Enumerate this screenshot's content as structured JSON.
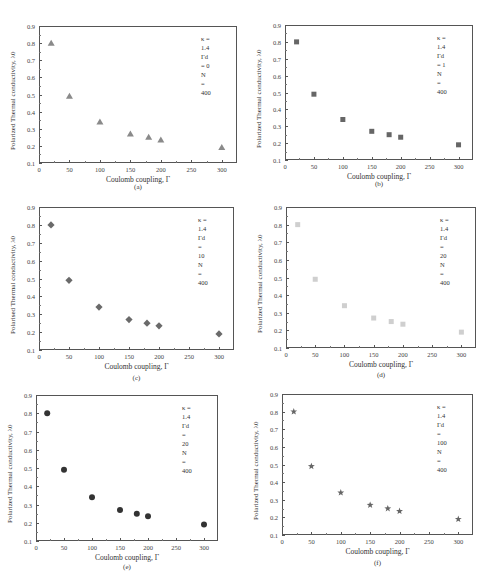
{
  "chart_data": [
    {
      "id": "a",
      "type": "scatter",
      "caption": "(a)",
      "marker": "triangle",
      "color": "#8a8a8a",
      "xlabel": "Coulomb coupling, Γ",
      "ylabel": "Polarized Thermal conductivity, λ0",
      "xlim": [
        0,
        325
      ],
      "ylim": [
        0.1,
        0.9
      ],
      "xticks": [
        0,
        50,
        100,
        150,
        200,
        250,
        300
      ],
      "yticks": [
        0.1,
        0.2,
        0.3,
        0.4,
        0.5,
        0.6,
        0.7,
        0.8,
        0.9
      ],
      "legend": [
        "κ = 1.4",
        "Γd = 0",
        "N = 400"
      ],
      "x": [
        20,
        50,
        100,
        150,
        180,
        200,
        300
      ],
      "y": [
        0.8,
        0.49,
        0.34,
        0.27,
        0.25,
        0.235,
        0.19
      ]
    },
    {
      "id": "b",
      "type": "scatter",
      "caption": "(b)",
      "marker": "square",
      "color": "#666666",
      "xlabel": "Coulomb coupling, Γ",
      "ylabel": "Polarized Thermal conductivity, λ0",
      "xlim": [
        0,
        325
      ],
      "ylim": [
        0.1,
        0.9
      ],
      "xticks": [
        0,
        50,
        100,
        150,
        200,
        250,
        300
      ],
      "yticks": [
        0.1,
        0.2,
        0.3,
        0.4,
        0.5,
        0.6,
        0.7,
        0.8,
        0.9
      ],
      "legend": [
        "κ = 1.4",
        "Γd = 1",
        "N = 400"
      ],
      "x": [
        20,
        50,
        100,
        150,
        180,
        200,
        300
      ],
      "y": [
        0.8,
        0.49,
        0.34,
        0.27,
        0.25,
        0.235,
        0.19
      ]
    },
    {
      "id": "c",
      "type": "scatter",
      "caption": "(c)",
      "marker": "diamond",
      "color": "#6a6a6a",
      "xlabel": "Coulomb coupling, Γ",
      "ylabel": "Polarised Thermal conductivity, λ0",
      "xlim": [
        0,
        325
      ],
      "ylim": [
        0.1,
        0.9
      ],
      "xticks": [
        0,
        50,
        100,
        150,
        200,
        250,
        300
      ],
      "yticks": [
        0.1,
        0.2,
        0.3,
        0.4,
        0.5,
        0.6,
        0.7,
        0.8,
        0.9
      ],
      "legend": [
        "κ = 1.4",
        "Γd = 10",
        "N = 400"
      ],
      "x": [
        20,
        50,
        100,
        150,
        180,
        200,
        300
      ],
      "y": [
        0.8,
        0.49,
        0.34,
        0.27,
        0.25,
        0.235,
        0.19
      ]
    },
    {
      "id": "d",
      "type": "scatter",
      "caption": "(d)",
      "marker": "square-light",
      "color": "#cfcfcf",
      "xlabel": "Coulomb coupling, Γ",
      "ylabel": "Polarized Thermal conductivity, λ0",
      "xlim": [
        0,
        325
      ],
      "ylim": [
        0.1,
        0.9
      ],
      "xticks": [
        0,
        50,
        100,
        150,
        200,
        250,
        300
      ],
      "yticks": [
        0.1,
        0.2,
        0.3,
        0.4,
        0.5,
        0.6,
        0.7,
        0.8,
        0.9
      ],
      "legend": [
        "κ = 1.4",
        "Γd = 20",
        "N = 400"
      ],
      "x": [
        20,
        50,
        100,
        150,
        180,
        200,
        300
      ],
      "y": [
        0.8,
        0.49,
        0.34,
        0.27,
        0.25,
        0.235,
        0.19
      ]
    },
    {
      "id": "e",
      "type": "scatter",
      "caption": "(e)",
      "marker": "circle",
      "color": "#333333",
      "xlabel": "Coulomb coupling, Γ",
      "ylabel": "Polarized Thermal conductivity, λ0",
      "xlim": [
        0,
        325
      ],
      "ylim": [
        0.1,
        0.9
      ],
      "xticks": [
        0,
        50,
        100,
        150,
        200,
        250,
        300
      ],
      "yticks": [
        0.1,
        0.2,
        0.3,
        0.4,
        0.5,
        0.6,
        0.7,
        0.8,
        0.9
      ],
      "legend": [
        "κ = 1.4",
        "Γd = 20",
        "N = 400"
      ],
      "x": [
        20,
        50,
        100,
        150,
        180,
        200,
        300
      ],
      "y": [
        0.8,
        0.49,
        0.34,
        0.27,
        0.25,
        0.235,
        0.19
      ]
    },
    {
      "id": "f",
      "type": "scatter",
      "caption": "(f)",
      "marker": "star",
      "color": "#666666",
      "xlabel": "Coulomb coupling, Γ",
      "ylabel": "Polarized Thermal conductivity, λ0",
      "xlim": [
        0,
        325
      ],
      "ylim": [
        0.1,
        0.9
      ],
      "xticks": [
        0,
        50,
        100,
        150,
        200,
        250,
        300
      ],
      "yticks": [
        0.1,
        0.2,
        0.3,
        0.4,
        0.5,
        0.6,
        0.7,
        0.8,
        0.9
      ],
      "legend": [
        "κ = 1.4",
        "Γd = 100",
        "N = 400"
      ],
      "x": [
        20,
        50,
        100,
        150,
        180,
        200,
        300
      ],
      "y": [
        0.8,
        0.49,
        0.34,
        0.27,
        0.25,
        0.235,
        0.19
      ]
    }
  ],
  "layout": {
    "panels": [
      {
        "left": 39,
        "top": 26,
        "right": 237,
        "bottom": 163,
        "caption_y": 183
      },
      {
        "left": 285,
        "top": 25,
        "right": 473,
        "bottom": 160,
        "caption_y": 180
      },
      {
        "left": 39,
        "top": 207,
        "right": 234,
        "bottom": 350,
        "caption_y": 374
      },
      {
        "left": 286,
        "top": 207,
        "right": 476,
        "bottom": 348,
        "caption_y": 371
      },
      {
        "left": 36,
        "top": 395,
        "right": 218,
        "bottom": 541,
        "caption_y": 563
      },
      {
        "left": 282,
        "top": 394,
        "right": 473,
        "bottom": 535,
        "caption_y": 559
      }
    ]
  }
}
